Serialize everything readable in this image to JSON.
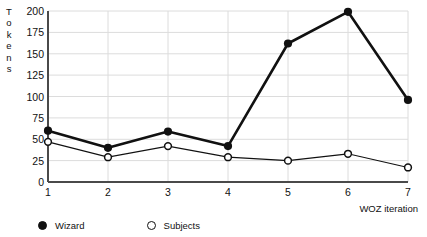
{
  "chart_data": {
    "type": "line",
    "title": "",
    "xlabel": "WOZ iteration",
    "ylabel": "Tokens",
    "ylabel_letters": [
      "T",
      "o",
      "k",
      "e",
      "n",
      "s"
    ],
    "x": [
      1,
      2,
      3,
      4,
      5,
      6,
      7
    ],
    "xticks": [
      "1",
      "2",
      "3",
      "4",
      "5",
      "6",
      "7"
    ],
    "yticks": [
      "0",
      "25",
      "50",
      "75",
      "100",
      "125",
      "150",
      "175",
      "200"
    ],
    "ytick_values": [
      0,
      25,
      50,
      75,
      100,
      125,
      150,
      175,
      200
    ],
    "xlim": [
      1,
      7
    ],
    "ylim": [
      0,
      200
    ],
    "grid": true,
    "grid_axis": "y",
    "legend_position": "below-plot-left",
    "series": [
      {
        "name": "Wizard",
        "marker": "filled-circle",
        "color": "#111111",
        "line_width": 2.6,
        "values": [
          60,
          40,
          59,
          42,
          162,
          199,
          96
        ]
      },
      {
        "name": "Subjects",
        "marker": "open-circle",
        "color": "#111111",
        "line_width": 1.2,
        "values": [
          47,
          29,
          42,
          29,
          25,
          33,
          17
        ]
      }
    ]
  },
  "legend": {
    "entries": [
      {
        "label": "Wizard",
        "marker": "filled-circle"
      },
      {
        "label": "Subjects",
        "marker": "open-circle"
      }
    ]
  },
  "colors": {
    "ink": "#111111",
    "axis": "#4a4a4a",
    "grid": "#d9d9d9",
    "background": "#ffffff"
  }
}
